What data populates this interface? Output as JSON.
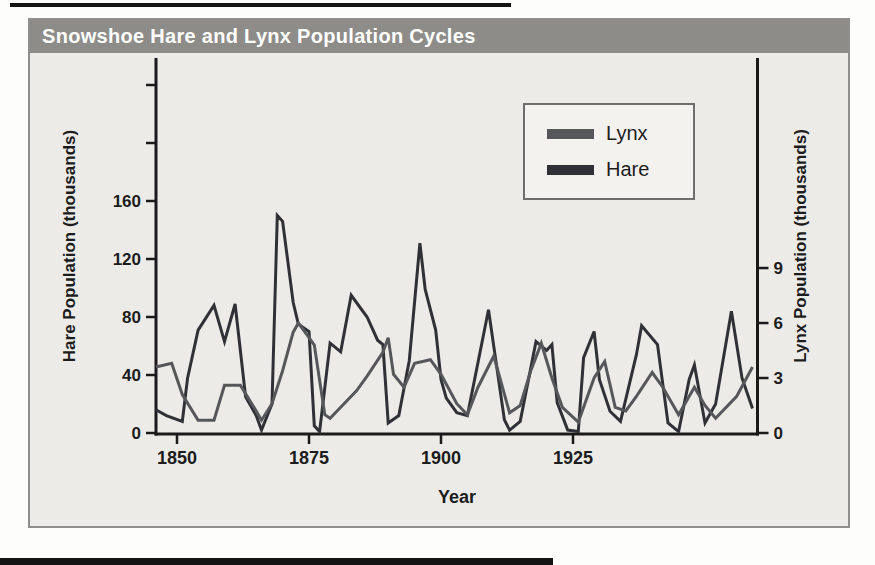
{
  "page": {
    "top_rule_color": "#141414",
    "bottom_rule_color": "#141414",
    "background": "#fdfdfc"
  },
  "figure": {
    "title": "Snowshoe Hare and Lynx Population Cycles",
    "title_bar_color": "#8e8c89",
    "title_text_color": "#ffffff",
    "background": "#edebe8",
    "border_color": "#8f8f8d"
  },
  "legend": {
    "items": [
      {
        "label": "Lynx",
        "color": "#55575a"
      },
      {
        "label": "Hare",
        "color": "#2f3136"
      }
    ]
  },
  "chart_data": {
    "type": "line",
    "title": "Snowshoe Hare and Lynx Population Cycles",
    "xlabel": "Year",
    "ylabel_left": "Hare Population (thousands)",
    "ylabel_right": "Lynx Population (thousands)",
    "x_range": [
      1846,
      1960
    ],
    "x_ticks": [
      1850,
      1875,
      1900,
      1925
    ],
    "left_ylim": [
      0,
      160
    ],
    "left_ticks": [
      0,
      40,
      80,
      120,
      160
    ],
    "left_unlabeled_ticks": [
      200,
      240
    ],
    "right_ylim": [
      0,
      9
    ],
    "right_ticks": [
      0,
      3,
      6,
      9
    ],
    "grid": false,
    "legend_position": "upper middle",
    "axis_color": "#1a1a1a",
    "series": [
      {
        "name": "Hare",
        "axis": "left",
        "color": "#2f3136",
        "points": [
          [
            1846,
            16
          ],
          [
            1848,
            12
          ],
          [
            1851,
            8
          ],
          [
            1852,
            38
          ],
          [
            1854,
            71
          ],
          [
            1857,
            88
          ],
          [
            1859,
            63
          ],
          [
            1861,
            89
          ],
          [
            1863,
            25
          ],
          [
            1865,
            12
          ],
          [
            1866,
            2
          ],
          [
            1868,
            20
          ],
          [
            1869,
            150
          ],
          [
            1870,
            146
          ],
          [
            1872,
            90
          ],
          [
            1873,
            75
          ],
          [
            1875,
            70
          ],
          [
            1876,
            5
          ],
          [
            1877,
            1
          ],
          [
            1879,
            62
          ],
          [
            1881,
            56
          ],
          [
            1883,
            95
          ],
          [
            1886,
            80
          ],
          [
            1888,
            64
          ],
          [
            1889,
            61
          ],
          [
            1890,
            7
          ],
          [
            1892,
            12
          ],
          [
            1894,
            50
          ],
          [
            1896,
            131
          ],
          [
            1897,
            99
          ],
          [
            1899,
            71
          ],
          [
            1900,
            37
          ],
          [
            1901,
            24
          ],
          [
            1903,
            14
          ],
          [
            1905,
            12
          ],
          [
            1909,
            85
          ],
          [
            1912,
            9
          ],
          [
            1913,
            2
          ],
          [
            1915,
            8
          ],
          [
            1918,
            63
          ],
          [
            1920,
            57
          ],
          [
            1921,
            61
          ],
          [
            1922,
            21
          ],
          [
            1924,
            2
          ],
          [
            1926,
            1
          ],
          [
            1927,
            52
          ],
          [
            1929,
            70
          ],
          [
            1930,
            37
          ],
          [
            1932,
            15
          ],
          [
            1934,
            8
          ],
          [
            1937,
            54
          ],
          [
            1938,
            74
          ],
          [
            1941,
            61
          ],
          [
            1943,
            7
          ],
          [
            1945,
            1
          ],
          [
            1947,
            37
          ],
          [
            1948,
            47
          ],
          [
            1950,
            7
          ],
          [
            1952,
            20
          ],
          [
            1955,
            84
          ],
          [
            1957,
            38
          ],
          [
            1959,
            17
          ]
        ]
      },
      {
        "name": "Lynx",
        "axis": "right",
        "color": "#55575a",
        "points": [
          [
            1846,
            3.6
          ],
          [
            1849,
            3.8
          ],
          [
            1851,
            2.1
          ],
          [
            1854,
            0.7
          ],
          [
            1857,
            0.7
          ],
          [
            1859,
            2.6
          ],
          [
            1862,
            2.6
          ],
          [
            1865,
            1.2
          ],
          [
            1866,
            0.7
          ],
          [
            1868,
            1.6
          ],
          [
            1870,
            3.4
          ],
          [
            1872,
            5.5
          ],
          [
            1873,
            6.0
          ],
          [
            1875,
            5.2
          ],
          [
            1876,
            4.8
          ],
          [
            1878,
            1.0
          ],
          [
            1879,
            0.8
          ],
          [
            1881,
            1.4
          ],
          [
            1884,
            2.3
          ],
          [
            1886,
            3.1
          ],
          [
            1889,
            4.4
          ],
          [
            1890,
            5.2
          ],
          [
            1891,
            3.2
          ],
          [
            1893,
            2.5
          ],
          [
            1895,
            3.8
          ],
          [
            1898,
            4.0
          ],
          [
            1900,
            3.2
          ],
          [
            1903,
            1.6
          ],
          [
            1905,
            1.0
          ],
          [
            1907,
            2.5
          ],
          [
            1910,
            4.2
          ],
          [
            1913,
            1.1
          ],
          [
            1915,
            1.5
          ],
          [
            1917,
            3.4
          ],
          [
            1919,
            4.9
          ],
          [
            1921,
            3.0
          ],
          [
            1923,
            1.4
          ],
          [
            1926,
            0.6
          ],
          [
            1929,
            3.0
          ],
          [
            1931,
            3.9
          ],
          [
            1933,
            1.4
          ],
          [
            1935,
            1.2
          ],
          [
            1937,
            2.0
          ],
          [
            1940,
            3.3
          ],
          [
            1942,
            2.5
          ],
          [
            1945,
            1.0
          ],
          [
            1948,
            2.5
          ],
          [
            1950,
            1.5
          ],
          [
            1952,
            0.8
          ],
          [
            1956,
            2.0
          ],
          [
            1959,
            3.6
          ]
        ]
      }
    ]
  }
}
